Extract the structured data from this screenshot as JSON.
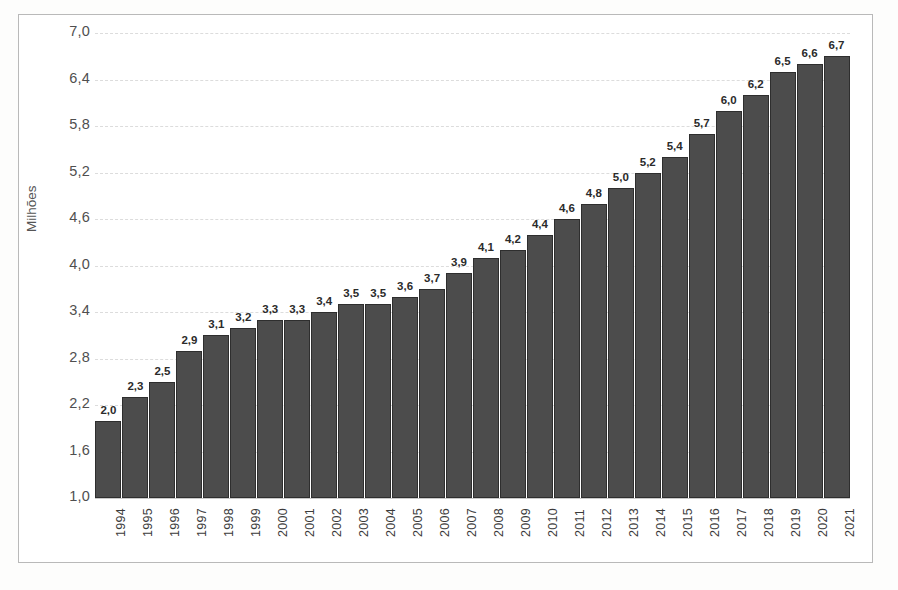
{
  "chart_data": {
    "type": "bar",
    "title": "",
    "xlabel": "",
    "ylabel": "Milhões",
    "ylim": [
      1.0,
      7.0
    ],
    "ytick_step": 0.6,
    "ytick_labels": [
      "7,0",
      "6,4",
      "5,8",
      "5,2",
      "4,6",
      "4,0",
      "3,4",
      "2,8",
      "2,2",
      "1,6",
      "1,0"
    ],
    "ytick_values": [
      7.0,
      6.4,
      5.8,
      5.2,
      4.6,
      4.0,
      3.4,
      2.8,
      2.2,
      1.6,
      1.0
    ],
    "grid": true,
    "legend": "none",
    "decimal_separator": ",",
    "categories": [
      "1994",
      "1995",
      "1996",
      "1997",
      "1998",
      "1999",
      "2000",
      "2001",
      "2002",
      "2003",
      "2004",
      "2005",
      "2006",
      "2007",
      "2008",
      "2009",
      "2010",
      "2011",
      "2012",
      "2013",
      "2014",
      "2015",
      "2016",
      "2017",
      "2018",
      "2019",
      "2020",
      "2021"
    ],
    "values": [
      2.0,
      2.3,
      2.5,
      2.9,
      3.1,
      3.2,
      3.3,
      3.3,
      3.4,
      3.5,
      3.5,
      3.6,
      3.7,
      3.9,
      4.1,
      4.2,
      4.4,
      4.6,
      4.8,
      5.0,
      5.2,
      5.4,
      5.7,
      6.0,
      6.2,
      6.5,
      6.6,
      6.7
    ],
    "value_labels": [
      "2,0",
      "2,3",
      "2,5",
      "2,9",
      "3,1",
      "3,2",
      "3,3",
      "3,3",
      "3,4",
      "3,5",
      "3,5",
      "3,6",
      "3,7",
      "3,9",
      "4,1",
      "4,2",
      "4,4",
      "4,6",
      "4,8",
      "5,0",
      "5,2",
      "5,4",
      "5,7",
      "6,0",
      "6,2",
      "6,5",
      "6,6",
      "6,7"
    ],
    "colors": {
      "bar_fill": "#4c4c4c",
      "bar_border": "#2e2e2e",
      "grid": "#dcdcdc",
      "tick_text": "#4f4f4f",
      "value_text": "#2b2b2b",
      "frame": "#b9b9b9",
      "background": "#ffffff"
    }
  }
}
